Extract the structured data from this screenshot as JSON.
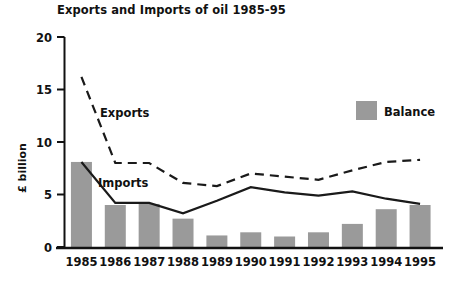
{
  "chart_data": {
    "type": "line",
    "title": "Exports and Imports of oil 1985-95",
    "xlabel": "",
    "ylabel": "£ billion",
    "categories": [
      "1985",
      "1986",
      "1987",
      "1988",
      "1989",
      "1990",
      "1991",
      "1992",
      "1993",
      "1994",
      "1995"
    ],
    "ylim": [
      0,
      20
    ],
    "yticks": [
      "0",
      "5",
      "10",
      "15",
      "20"
    ],
    "ytick_values": [
      0,
      5,
      10,
      15,
      20
    ],
    "grid": false,
    "legend_position": "top-right",
    "series": [
      {
        "name": "Balance",
        "type": "bar",
        "color": "#9a9a9a",
        "values": [
          8.1,
          4.0,
          4.1,
          2.7,
          1.1,
          1.4,
          1.0,
          1.4,
          2.2,
          3.6,
          4.0
        ]
      },
      {
        "name": "Exports",
        "type": "line",
        "style": "dashed",
        "color": "#1a1a1a",
        "values": [
          16.2,
          8.0,
          8.0,
          6.1,
          5.8,
          7.0,
          6.7,
          6.4,
          7.3,
          8.1,
          8.3
        ]
      },
      {
        "name": "Imports",
        "type": "line",
        "style": "solid",
        "color": "#1a1a1a",
        "values": [
          8.1,
          4.2,
          4.2,
          3.2,
          4.4,
          5.7,
          5.2,
          4.9,
          5.3,
          4.6,
          4.1
        ]
      }
    ],
    "annotations": [
      {
        "text": "Exports",
        "x": 100,
        "y": 117
      },
      {
        "text": "Imports",
        "x": 98,
        "y": 187
      }
    ],
    "legend": [
      {
        "label": "Balance",
        "color": "#9a9a9a"
      }
    ]
  }
}
